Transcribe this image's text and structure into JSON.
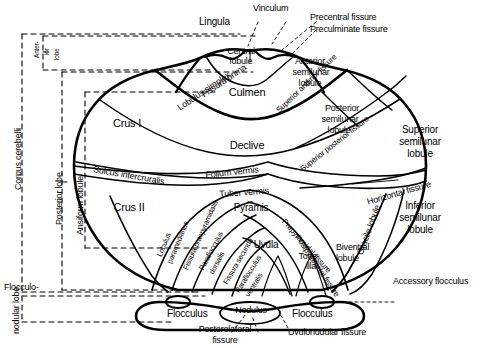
{
  "figure": {
    "ink_color": "#000000",
    "background_color": "#ffffff"
  },
  "brackets": {
    "corpus_cerebelli": "Corpus cerebelli",
    "anterior_lobe_l1": "Anter-",
    "anterior_lobe_l2": "ior",
    "anterior_lobe_l3": "lobe",
    "posterior_lobe": "Posterior lobe",
    "ansiform_lobule": "Ansiform lobule",
    "flocculonodular_l1": "Flocculo-",
    "flocculonodular_l2": "nodular lobe"
  },
  "top_labels": {
    "vinculum": "Vinculum",
    "lingula": "Lingula",
    "precentral_fissure": "Precentral fissure",
    "preculminate_fissure": "Preculminate fissure"
  },
  "vermis": {
    "central_lobule_l1": "Central",
    "central_lobule_l2": "lobule",
    "culmen": "Culmen",
    "declive": "Declive",
    "folium_vermis": "Folium vermis",
    "tuber_vermis": "Tuber vermis",
    "pyramis": "Pyramis",
    "uvula": "Uvula",
    "nodulus": "Nodulus",
    "tonsilla_l1": "Tons-",
    "tonsilla_l2": "illa"
  },
  "left_hemisphere": {
    "crus_i": "Crus I",
    "crus_ii": "Crus II",
    "lobulus_simplex": "Lobulus simplex",
    "fissura_prima": "Fissura prima",
    "sulcus_intercruralis": "Sulcus intercruralis",
    "lobulus_paramedianus_l1": "Lobulus",
    "lobulus_paramedianus_l2": "paramedianus",
    "fissura_praepyramidalis": "Fissura praepyramidalis",
    "paraflocculus_dorsalis_l1": "Paraflocculus",
    "paraflocculus_dorsalis_l2": "dorsalis",
    "fissura_secunda": "Fissura secunda",
    "paraflocculus_ventralis_l1": "Paraflocculus",
    "paraflocculus_ventralis_l2": "ventralis",
    "flocculus": "Flocculus"
  },
  "right_hemisphere": {
    "anterior_semilunar_l1": "Anterior",
    "anterior_semilunar_l2": "semilunar",
    "anterior_semilunar_l3": "lobule",
    "posterior_semilunar_l1": "Posterior",
    "posterior_semilunar_l2": "semilunar",
    "posterior_semilunar_l3": "lobule",
    "superior_semilunar_l1": "Superior",
    "superior_semilunar_l2": "semilunar",
    "superior_semilunar_l3": "lobule",
    "inferior_semilunar_l1": "Inferior",
    "inferior_semilunar_l2": "semilunar",
    "inferior_semilunar_l3": "lobule",
    "superior_anterior_fissure": "Superior anterior fissure",
    "superior_posterior_fissure": "Superior posterior fissure",
    "horizontal_fissure": "Horizontal fissure",
    "gracile_lobule": "Gracile lobule",
    "biventral_lobule_l1": "Biventral",
    "biventral_lobule_l2": "lobule",
    "prepyramidal_fissure": "Prepyramidal fissure",
    "postpyramidal_fissure": "Postpyramidal fissure",
    "accessory_flocculus": "Accessory flocculus",
    "flocculus": "Flocculus"
  },
  "bottom_labels": {
    "posterolateral_l1": "Posterolateral",
    "posterolateral_l2": "fissure",
    "uvulonodular_fissure": "Uvulonodular fissure"
  }
}
